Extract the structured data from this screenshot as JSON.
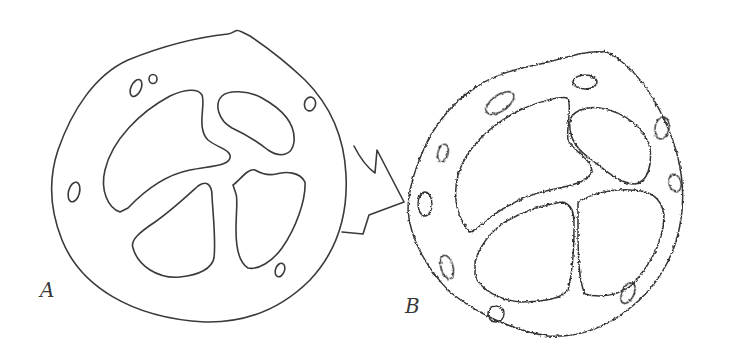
{
  "figure": {
    "panels": [
      {
        "id": "A",
        "label": "A",
        "description": "smooth cross-section with four inner lobes and small peripheral pores"
      },
      {
        "id": "B",
        "label": "B",
        "description": "roughened cross-section with four jagged inner lobes and irregular peripheral pores"
      }
    ],
    "arrow": {
      "from": "A",
      "to": "B",
      "style": "zigzag-lightning"
    },
    "colors": {
      "line": "#3a3a3a",
      "background": "#ffffff"
    }
  }
}
